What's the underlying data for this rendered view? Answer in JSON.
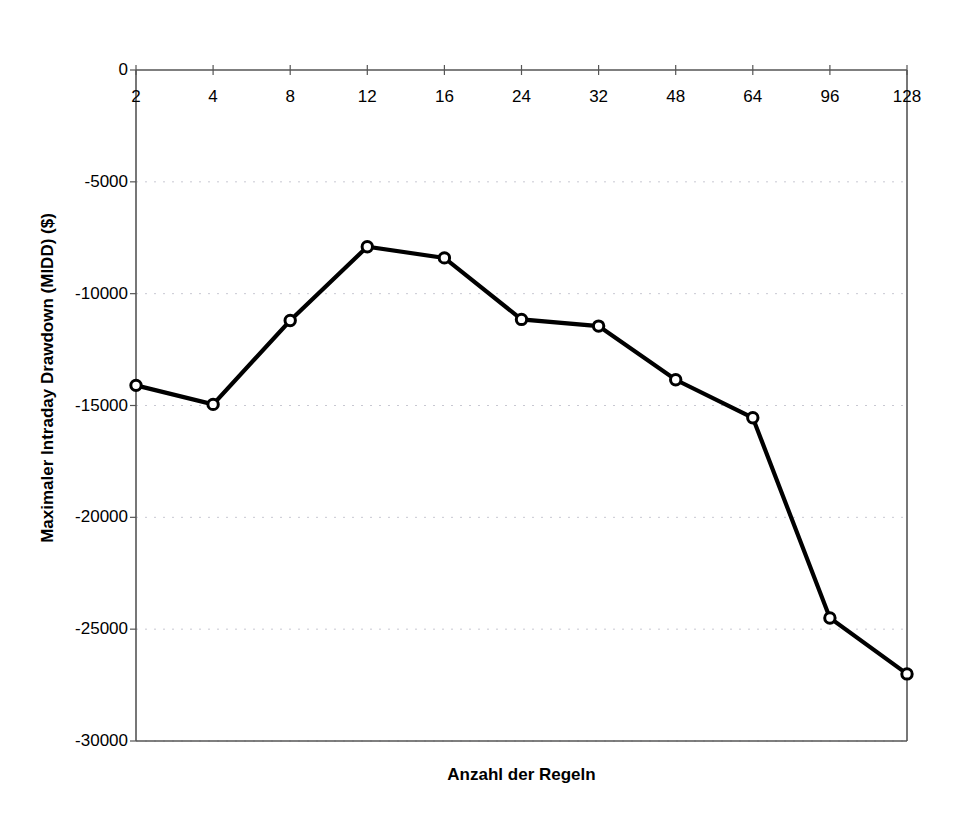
{
  "chart_data": {
    "type": "line",
    "title": "",
    "xlabel": "Anzahl der Regeln",
    "ylabel": "Maximaler Intraday Drawdown (MIDD) ($)",
    "categories": [
      "2",
      "4",
      "8",
      "12",
      "16",
      "24",
      "32",
      "48",
      "64",
      "96",
      "128"
    ],
    "values": [
      -14100,
      -14950,
      -11200,
      -7900,
      -8400,
      -11150,
      -11450,
      -13850,
      -15550,
      -24500,
      -27000
    ],
    "series": [
      {
        "name": "MIDD",
        "values": [
          -14100,
          -14950,
          -11200,
          -7900,
          -8400,
          -11150,
          -11450,
          -13850,
          -15550,
          -24500,
          -27000
        ]
      }
    ],
    "ylim": [
      -30000,
      0
    ],
    "yticks": [
      "0",
      "-5000",
      "-10000",
      "-15000",
      "-20000",
      "-25000",
      "-30000"
    ],
    "ytick_values": [
      0,
      -5000,
      -10000,
      -15000,
      -20000,
      -25000,
      -30000
    ],
    "xticks": [
      "2",
      "4",
      "8",
      "12",
      "16",
      "24",
      "32",
      "48",
      "64",
      "96",
      "128"
    ],
    "grid": "horizontal-dotted",
    "legend": "none",
    "marker": "open-circle",
    "line_color": "#000000",
    "grid_color": "#c8c8d2",
    "axis_color": "#555555",
    "background_color": "#ffffff",
    "xaxis_position": "top"
  }
}
